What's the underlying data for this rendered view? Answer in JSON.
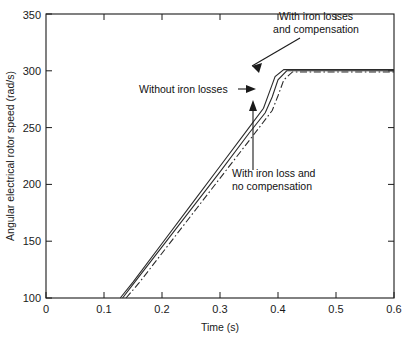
{
  "chart_data": {
    "type": "line",
    "title": "",
    "xlabel": "Time (s)",
    "ylabel": "Angular electrical rotor speed (rad/s)",
    "xlim": [
      0,
      0.6
    ],
    "ylim": [
      100,
      350
    ],
    "xticks": [
      0,
      0.1,
      0.2,
      0.3,
      0.4,
      0.5,
      0.6
    ],
    "xtick_labels": [
      "0",
      "0.1",
      "0.2",
      "0.3",
      "0.4",
      "0.5",
      "0.6"
    ],
    "yticks": [
      100,
      150,
      200,
      250,
      300,
      350
    ],
    "ytick_labels": [
      "100",
      "150",
      "200",
      "250",
      "300",
      "350"
    ],
    "grid": false,
    "legend": "none (inline annotations with arrows)",
    "series": [
      {
        "name": "Without iron losses",
        "style": "solid",
        "color": "#2b2b2b",
        "x": [
          0.128,
          0.15,
          0.2,
          0.25,
          0.3,
          0.35,
          0.375,
          0.385,
          0.395,
          0.41,
          0.45,
          0.5,
          0.55,
          0.6
        ],
        "y": [
          100,
          114,
          148,
          182,
          216,
          250,
          267,
          281,
          295,
          301,
          301,
          301,
          301,
          301
        ]
      },
      {
        "name": "With iron losses and compensation",
        "style": "solid",
        "color": "#2b2b2b",
        "x": [
          0.132,
          0.15,
          0.2,
          0.25,
          0.3,
          0.35,
          0.378,
          0.39,
          0.4,
          0.415,
          0.45,
          0.5,
          0.55,
          0.6
        ],
        "y": [
          100,
          112,
          145,
          178,
          211,
          245,
          263,
          277,
          292,
          300,
          300,
          300,
          300,
          300
        ]
      },
      {
        "name": "With iron loss and no compensation",
        "style": "dash-dot",
        "color": "#2b2b2b",
        "x": [
          0.138,
          0.16,
          0.21,
          0.26,
          0.31,
          0.36,
          0.39,
          0.4,
          0.41,
          0.425,
          0.46,
          0.5,
          0.55,
          0.6
        ],
        "y": [
          100,
          113,
          146,
          179,
          212,
          245,
          265,
          278,
          292,
          299,
          299,
          299,
          299,
          299
        ]
      }
    ],
    "annotations": [
      {
        "id": "annot-with-iron-losses-and-compensation",
        "line1": "With iron losses",
        "line2": "and compensation",
        "arrow": "points down-left to knee of curve near (0.385, 305)"
      },
      {
        "id": "annot-without-iron-losses",
        "line1": "Without iron losses",
        "line2": "",
        "arrow": "points right to ramp near (0.345, 272)"
      },
      {
        "id": "annot-with-iron-loss-and-no-compensation",
        "line1": "With iron loss and",
        "line2": "no compensation",
        "arrow": "points up to dash-dot ramp near (0.355, 245)"
      }
    ]
  },
  "colors": {
    "axis": "#1a1a1a",
    "curve": "#2b2b2b",
    "background": "#ffffff"
  }
}
